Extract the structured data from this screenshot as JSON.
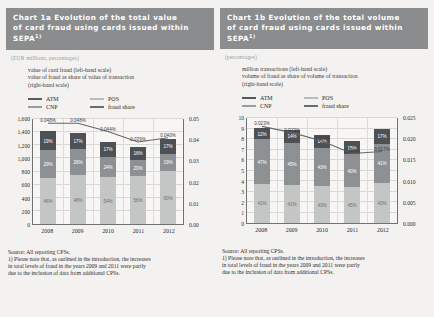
{
  "charts": [
    {
      "id": "chart-1a",
      "title_lines": [
        "Chart 1a Evolution of the total value",
        "of card fraud using cards issued within SEPA"
      ],
      "title_sup": "1)",
      "units": "(EUR millions, percentages)",
      "axis_desc": [
        "value of card fraud (left-hand scale)",
        "value of fraud as share of value of transaction",
        "(right-hand scale)"
      ],
      "legend": [
        {
          "key": "atm",
          "label": "ATM"
        },
        {
          "key": "pos",
          "label": "POS"
        },
        {
          "key": "cnp",
          "label": "CNP"
        },
        {
          "key": "line",
          "label": "fraud share"
        }
      ],
      "source_lines": [
        "Source: All reporting CPSs.",
        "1) Please note that, as outlined in the introduction, the increases",
        "in total levels of fraud in the years 2009 and 2011 were partly",
        "due to the inclusion of data from additional CPSs."
      ],
      "chart_data": {
        "type": "bar",
        "title": "Chart 1a Evolution of the total value of card fraud using cards issued within SEPA",
        "xlabel": "",
        "ylabel": "EUR millions",
        "y2label": "fraud share",
        "categories": [
          "2008",
          "2009",
          "2010",
          "2011",
          "2012"
        ],
        "ylim": [
          0,
          1600
        ],
        "yticks": [
          "0",
          "200",
          "400",
          "600",
          "800",
          "1,000",
          "1,200",
          "1,400",
          "1,600"
        ],
        "y2lim": [
          0,
          0.05
        ],
        "y2ticks": [
          "0.00",
          "0.01",
          "0.02",
          "0.03",
          "0.04",
          "0.05"
        ],
        "grid": true,
        "legend_position": "above-plot",
        "series": [
          {
            "name": "CNP",
            "type": "bar-segment",
            "values": [
              690,
              740,
              710,
              720,
              800
            ],
            "labels": [
              "46%",
              "48%",
              "54%",
              "56%",
              "60%"
            ]
          },
          {
            "name": "POS",
            "type": "bar-segment",
            "values": [
              430,
              400,
              310,
              250,
              260
            ],
            "labels": [
              "29%",
              "26%",
              "24%",
              "20%",
              "19%"
            ]
          },
          {
            "name": "ATM",
            "type": "bar-segment",
            "values": [
              280,
              235,
              225,
              200,
              230
            ],
            "labels": [
              "19%",
              "17%",
              "17%",
              "16%",
              "17%"
            ]
          },
          {
            "name": "fraud share",
            "type": "line",
            "values": [
              0.048,
              0.048,
              0.044,
              0.039,
              0.041
            ],
            "labels": [
              "0.048%",
              "0.048%",
              "0.044%",
              "0.039%",
              "0.040%"
            ]
          }
        ]
      }
    },
    {
      "id": "chart-1b",
      "title_lines": [
        "Chart 1b Evolution of the total volume",
        "of card fraud using cards issued within",
        "SEPA"
      ],
      "title_sup": "1)",
      "units": "(percentages)",
      "axis_desc": [
        "million transactions (left-hand scale)",
        "volume of fraud as share of volume of transaction",
        "(right-hand scale)"
      ],
      "legend": [
        {
          "key": "atm",
          "label": "ATM"
        },
        {
          "key": "pos",
          "label": "POS"
        },
        {
          "key": "cnp",
          "label": "CNP"
        },
        {
          "key": "line",
          "label": "fraud share"
        }
      ],
      "source_lines": [
        "Source: All reporting CPSs.",
        "1) Please note that, as outlined in the introduction, the increases",
        "in total levels of fraud in the years 2009 and 2011 were partly",
        "due to the inclusion of data from additional CPSs."
      ],
      "chart_data": {
        "type": "bar",
        "title": "Chart 1b Evolution of the total volume of card fraud using cards issued within SEPA",
        "xlabel": "",
        "ylabel": "million transactions",
        "y2label": "fraud share",
        "categories": [
          "2008",
          "2009",
          "2010",
          "2011",
          "2012"
        ],
        "ylim": [
          0,
          10
        ],
        "yticks": [
          "0",
          "1",
          "2",
          "3",
          "4",
          "5",
          "6",
          "7",
          "8",
          "9",
          "10"
        ],
        "y2lim": [
          0,
          0.025
        ],
        "y2ticks": [
          "0.000",
          "0.005",
          "0.010",
          "0.015",
          "0.020",
          "0.025"
        ],
        "grid": true,
        "legend_position": "above-plot",
        "series": [
          {
            "name": "CNP",
            "type": "bar-segment",
            "values": [
              3.7,
              3.6,
              3.5,
              3.4,
              3.8
            ],
            "labels": [
              "41%",
              "41%",
              "43%",
              "45%",
              "43%"
            ]
          },
          {
            "name": "POS",
            "type": "bar-segment",
            "values": [
              4.2,
              4.0,
              3.6,
              3.1,
              3.7
            ],
            "labels": [
              "47%",
              "45%",
              "43%",
              "40%",
              "41%"
            ]
          },
          {
            "name": "ATM",
            "type": "bar-segment",
            "values": [
              1.1,
              1.2,
              1.2,
              1.2,
              1.4
            ],
            "labels": [
              "12%",
              "14%",
              "14%",
              "15%",
              "17%"
            ]
          },
          {
            "name": "fraud share",
            "type": "line",
            "values": [
              0.023,
              0.0215,
              0.0195,
              0.0165,
              0.017
            ],
            "labels": [
              "0.023%",
              "0.023%",
              "0.019%",
              "0.017%",
              "0.017%"
            ]
          }
        ]
      }
    }
  ]
}
